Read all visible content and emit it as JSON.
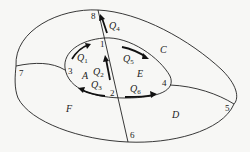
{
  "diagram": {
    "nodes": [
      "1",
      "2",
      "3",
      "4",
      "5",
      "6",
      "7",
      "8"
    ],
    "regions": [
      "A",
      "C",
      "D",
      "E",
      "F"
    ],
    "flows": [
      {
        "name": "Q",
        "sub": "1"
      },
      {
        "name": "Q",
        "sub": "2"
      },
      {
        "name": "Q",
        "sub": "3"
      },
      {
        "name": "Q",
        "sub": "4"
      },
      {
        "name": "Q",
        "sub": "5"
      },
      {
        "name": "Q",
        "sub": "6"
      }
    ]
  }
}
